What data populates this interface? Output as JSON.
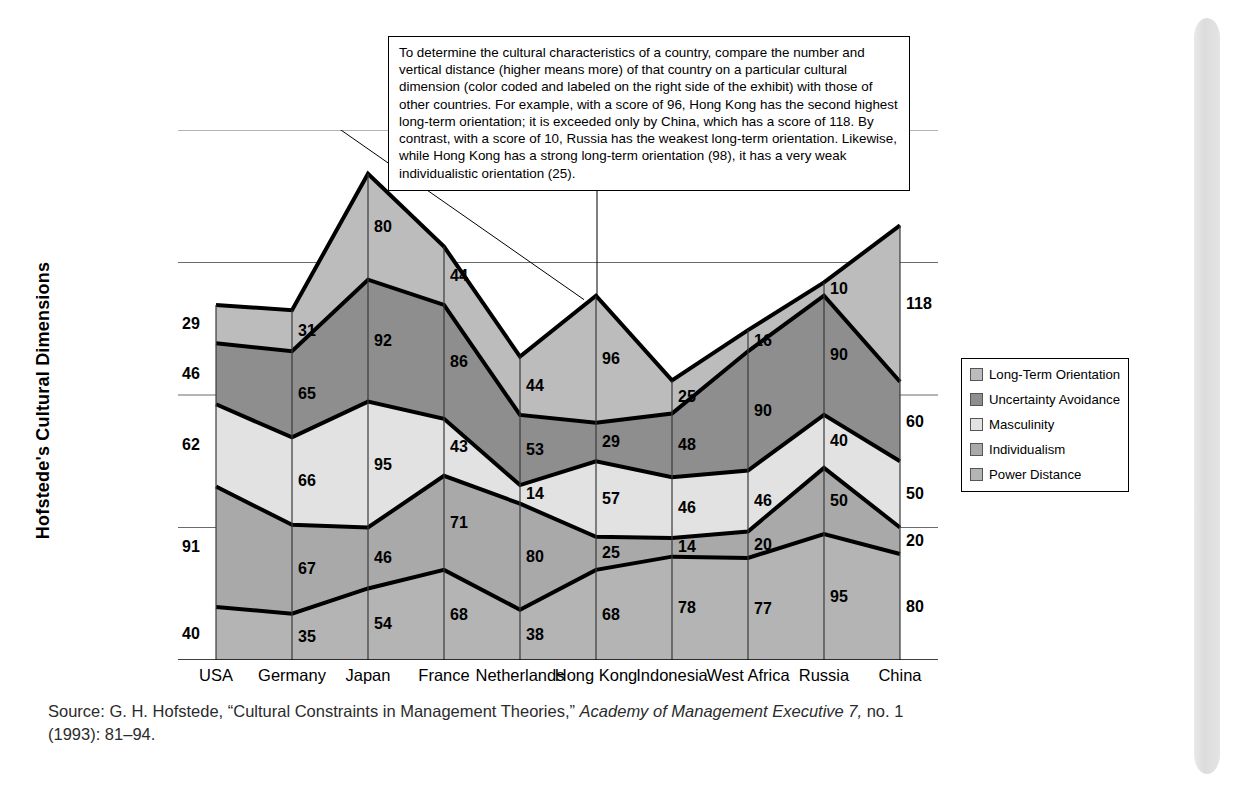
{
  "exhibit": {
    "y_axis_title": "Hofstede's Cultural Dimensions",
    "callout_text": "To determine the cultural characteristics of a country, compare the number and vertical distance (higher means more) of that country on a particular cultural dimension (color coded and labeled on the right side of the exhibit) with those of other countries.  For example, with a score of 96, Hong Kong has the second highest long-term orientation; it is exceeded only by China, which has a score of 118.  By contrast, with a score of 10, Russia has the weakest long-term orientation.  Likewise, while Hong Kong has a strong long-term orientation (98), it has a very weak individualistic orientation (25).",
    "source_prefix": "Source: G. H. Hofstede, “Cultural Constraints in Management Theories,” ",
    "source_journal": "Academy of Management Executive 7,",
    "source_suffix": " no. 1 (1993): 81–94."
  },
  "chart_data": {
    "type": "area",
    "title": "Hofstede's Cultural Dimensions",
    "xlabel": "",
    "ylabel": "Hofstede's Cultural Dimensions",
    "stacked": true,
    "grid": true,
    "legend_position": "right",
    "ylim": [
      0,
      400
    ],
    "categories": [
      "USA",
      "Germany",
      "Japan",
      "France",
      "Netherlands",
      "Hong Kong",
      "Indonesia",
      "West Africa",
      "Russia",
      "China"
    ],
    "series": [
      {
        "name": "Power Distance",
        "color": "#b4b4b4",
        "values": [
          40,
          35,
          54,
          68,
          38,
          68,
          78,
          77,
          95,
          80
        ]
      },
      {
        "name": "Individualism",
        "color": "#a9a9a9",
        "values": [
          91,
          67,
          46,
          71,
          80,
          25,
          14,
          20,
          50,
          20
        ]
      },
      {
        "name": "Masculinity",
        "color": "#e2e2e2",
        "values": [
          62,
          66,
          95,
          43,
          14,
          57,
          46,
          46,
          40,
          50
        ]
      },
      {
        "name": "Uncertainty Avoidance",
        "color": "#8e8e8e",
        "values": [
          46,
          65,
          92,
          86,
          53,
          29,
          48,
          90,
          90,
          60
        ]
      },
      {
        "name": "Long-Term Orientation",
        "color": "#bcbcbc",
        "values": [
          29,
          31,
          80,
          44,
          44,
          96,
          25,
          16,
          10,
          118
        ]
      }
    ],
    "legend": [
      "Long-Term Orientation",
      "Uncertainty Avoidance",
      "Masculinity",
      "Individualism",
      "Power Distance"
    ]
  }
}
